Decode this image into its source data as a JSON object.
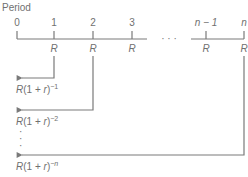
{
  "diagram": {
    "title": "Period",
    "ticks": [
      {
        "label": "0",
        "x": 17,
        "payment": ""
      },
      {
        "label": "1",
        "x": 54,
        "payment": "R"
      },
      {
        "label": "2",
        "x": 93,
        "payment": "R"
      },
      {
        "label": "3",
        "x": 132,
        "payment": "R"
      },
      {
        "label": "n − 1",
        "x": 206,
        "payment": "R"
      },
      {
        "label": "n",
        "x": 244,
        "payment": "R"
      }
    ],
    "ellipsis": "· · ·",
    "vertical_ellipsis": "⋮",
    "discounts": [
      {
        "from_period": "1",
        "base": "R(1 + r)",
        "exponent": "−1"
      },
      {
        "from_period": "2",
        "base": "R(1 + r)",
        "exponent": "−2"
      },
      {
        "from_period": "n",
        "base": "R(1 + r)",
        "exponent": "−n"
      }
    ],
    "colors": {
      "line": "#7a7a7a",
      "text": "#707070",
      "background": "#ffffff"
    }
  }
}
